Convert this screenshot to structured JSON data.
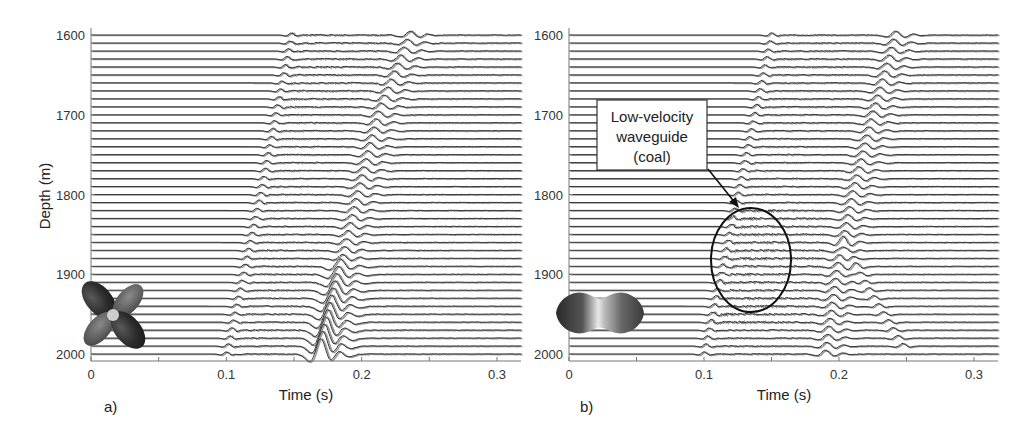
{
  "figure": {
    "ylabel": "Depth  (m)",
    "xlabel": "Time (s)"
  },
  "panels": [
    {
      "id": "a",
      "label": "a)",
      "xlabel": "Time (s)",
      "x_ticks": [
        "0",
        "0.1",
        "0.2",
        "0.3"
      ],
      "y_ticks": [
        "1600",
        "1700",
        "1800",
        "1900",
        "2000"
      ],
      "source_icon": "four-lobe-radiation-pattern-icon"
    },
    {
      "id": "b",
      "label": "b)",
      "xlabel": "Time (s)",
      "x_ticks": [
        "0",
        "0.1",
        "0.2",
        "0.3"
      ],
      "y_ticks": [
        "1600",
        "1700",
        "1800",
        "1900",
        "2000"
      ],
      "source_icon": "two-lobe-radiation-pattern-icon",
      "callout": {
        "lines": [
          "Low-velocity",
          "waveguide",
          "(coal)"
        ]
      }
    }
  ],
  "chart_data": [
    {
      "type": "line",
      "title": "a) Synthetic VSP seismograms (four-lobe source radiation pattern)",
      "xlabel": "Time (s)",
      "ylabel": "Depth  (m)",
      "xlim": [
        0,
        0.318
      ],
      "ylim": [
        2010,
        1595
      ],
      "x_ticks": [
        0,
        0.1,
        0.2,
        0.3
      ],
      "y_ticks": [
        1600,
        1700,
        1800,
        1900,
        2000
      ],
      "grid": false,
      "trace_depths": {
        "start": 1600,
        "end": 2000,
        "step": 10
      },
      "arrivals": [
        {
          "name": "P (faint)",
          "depths": [
            1600,
            1800,
            2000
          ],
          "times": [
            0.148,
            0.125,
            0.1
          ]
        },
        {
          "name": "S (strong)",
          "depths": [
            1600,
            1700,
            1800,
            1900,
            2000
          ],
          "times": [
            0.236,
            0.212,
            0.197,
            0.183,
            0.17
          ]
        }
      ],
      "annotations": []
    },
    {
      "type": "line",
      "title": "b) Synthetic VSP seismograms (two-lobe source radiation pattern)",
      "xlabel": "Time (s)",
      "ylabel": "Depth  (m)",
      "xlim": [
        0,
        0.318
      ],
      "ylim": [
        2010,
        1595
      ],
      "x_ticks": [
        0,
        0.1,
        0.2,
        0.3
      ],
      "y_ticks": [
        1600,
        1700,
        1800,
        1900,
        2000
      ],
      "grid": false,
      "trace_depths": {
        "start": 1600,
        "end": 2000,
        "step": 10
      },
      "arrivals": [
        {
          "name": "P",
          "depths": [
            1600,
            1800,
            2000
          ],
          "times": [
            0.15,
            0.125,
            0.1
          ]
        },
        {
          "name": "S",
          "depths": [
            1600,
            1700,
            1800,
            1900,
            2000
          ],
          "times": [
            0.242,
            0.225,
            0.21,
            0.198,
            0.19
          ]
        },
        {
          "name": "S reflected",
          "depths": [
            1860,
            1920,
            1970
          ],
          "times": [
            0.203,
            0.222,
            0.24
          ]
        }
      ],
      "annotations": [
        {
          "text": "Low-velocity waveguide (coal)",
          "ellipse_center": {
            "time": 0.134,
            "depth": 1885
          },
          "kind": "arrow-to-ellipse"
        }
      ]
    }
  ]
}
